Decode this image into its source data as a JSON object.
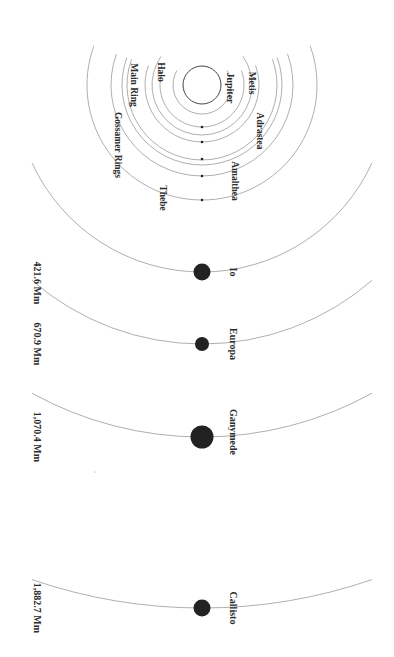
{
  "diagram": {
    "center": {
      "x": 202,
      "y": 85
    },
    "planet": {
      "name": "Jupiter",
      "radius": 19,
      "label_pos": {
        "x": 229,
        "y": 88
      }
    },
    "rings": [
      {
        "name": "Halo",
        "radius": 29,
        "label_pos": {
          "x": 160,
          "y": 72
        }
      },
      {
        "name": "Main Ring",
        "radius": 50,
        "label_pos": {
          "x": 133,
          "y": 85
        }
      },
      {
        "name": "Gossamer Rings",
        "radius": 80,
        "label_pos": {
          "x": 117,
          "y": 145
        }
      }
    ],
    "inner_moons": [
      {
        "name": "Metis",
        "orbit_radius": 42,
        "dot_y": 127,
        "label_pos": {
          "x": 251,
          "y": 83
        }
      },
      {
        "name": "Adrastea",
        "orbit_radius": 57,
        "dot_y": 142,
        "label_pos": {
          "x": 259,
          "y": 131
        }
      },
      {
        "name": "Amalthea",
        "orbit_radius": 75,
        "dot_y": 159,
        "label_pos": {
          "x": 234,
          "y": 181
        }
      },
      {
        "name": "Thebe",
        "orbit_radius": 115,
        "dot_y": 200,
        "label_pos": {
          "x": 162,
          "y": 198
        }
      },
      {
        "name": "",
        "orbit_radius": 91,
        "dot_y": 176,
        "label_pos": null
      }
    ],
    "galilean_moons": [
      {
        "name": "Io",
        "orbit_radius": 187,
        "dot_y": 272,
        "dot_r": 8.5,
        "distance": "421.6 Mm",
        "label_y": 272,
        "distance_y": 283
      },
      {
        "name": "Europa",
        "orbit_radius": 259,
        "dot_y": 344,
        "dot_r": 7,
        "distance": "670.9 Mm",
        "label_y": 344,
        "distance_y": 344
      },
      {
        "name": "Ganymede",
        "orbit_radius": 352,
        "dot_y": 437,
        "dot_r": 11.5,
        "distance": "1,070.4 Mm",
        "label_y": 432,
        "distance_y": 437
      },
      {
        "name": "Callisto",
        "orbit_radius": 523,
        "dot_y": 608,
        "dot_r": 8.5,
        "distance": "1,882.7 Mm",
        "label_y": 608,
        "distance_y": 608
      }
    ],
    "label_x": {
      "moon_names": 232,
      "distances": 36
    },
    "colors": {
      "orbit": "#9a9a9a",
      "moon": "#222222",
      "text": "#2b2b2b"
    }
  }
}
